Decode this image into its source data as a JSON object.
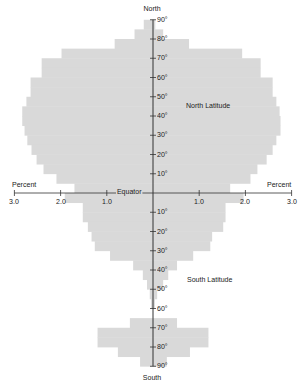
{
  "chart_data": {
    "type": "bar",
    "orientation": "horizontal-butterfly",
    "title": "",
    "xlabel": "Percent",
    "ylabel": "Latitude",
    "xlim": [
      -3.0,
      3.0
    ],
    "ylim": [
      -90,
      90
    ],
    "x_ticks": [
      "3.0",
      "2.0",
      "1.0",
      "1.0",
      "2.0",
      "3.0"
    ],
    "x_tick_values": [
      -3.0,
      -2.0,
      -1.0,
      1.0,
      2.0,
      3.0
    ],
    "north_ticks": [
      "90°",
      "80°",
      "70°",
      "60°",
      "50°",
      "40°",
      "30°",
      "20°",
      "10°"
    ],
    "south_ticks": [
      "10°",
      "20°",
      "30°",
      "40°",
      "50°",
      "60°",
      "70°",
      "80°",
      "90°"
    ],
    "annotations": {
      "top": "North",
      "bottom": "South",
      "equator": "Equator",
      "north_region": "North Latitude",
      "south_region": "South Latitude",
      "percent_left": "Percent",
      "percent_right": "Percent"
    },
    "fill_color": "#d9d9d9",
    "axis_color": "#333333",
    "series": [
      {
        "name": "Left",
        "bands": [
          {
            "from": 85,
            "to": 90,
            "value": 0.2
          },
          {
            "from": 80,
            "to": 85,
            "value": 0.4
          },
          {
            "from": 75,
            "to": 80,
            "value": 0.83
          },
          {
            "from": 70,
            "to": 75,
            "value": 1.98
          },
          {
            "from": 65,
            "to": 70,
            "value": 2.41
          },
          {
            "from": 60,
            "to": 65,
            "value": 2.41
          },
          {
            "from": 55,
            "to": 60,
            "value": 2.65
          },
          {
            "from": 50,
            "to": 55,
            "value": 2.65
          },
          {
            "from": 45,
            "to": 50,
            "value": 2.74
          },
          {
            "from": 40,
            "to": 45,
            "value": 2.83
          },
          {
            "from": 35,
            "to": 40,
            "value": 2.83
          },
          {
            "from": 30,
            "to": 35,
            "value": 2.78
          },
          {
            "from": 25,
            "to": 30,
            "value": 2.72
          },
          {
            "from": 20,
            "to": 25,
            "value": 2.63
          },
          {
            "from": 15,
            "to": 20,
            "value": 2.52
          },
          {
            "from": 10,
            "to": 15,
            "value": 2.37
          },
          {
            "from": 5,
            "to": 10,
            "value": 2.09
          },
          {
            "from": 0,
            "to": 5,
            "value": 1.7
          },
          {
            "from": -5,
            "to": 0,
            "value": 1.91
          },
          {
            "from": -10,
            "to": -5,
            "value": 1.52
          },
          {
            "from": -15,
            "to": -10,
            "value": 1.52
          },
          {
            "from": -20,
            "to": -15,
            "value": 1.41
          },
          {
            "from": -25,
            "to": -20,
            "value": 1.33
          },
          {
            "from": -30,
            "to": -25,
            "value": 1.26
          },
          {
            "from": -35,
            "to": -30,
            "value": 0.93
          },
          {
            "from": -40,
            "to": -35,
            "value": 0.43
          },
          {
            "from": -45,
            "to": -40,
            "value": 0.22
          },
          {
            "from": -50,
            "to": -45,
            "value": 0.13
          },
          {
            "from": -55,
            "to": -50,
            "value": 0.07
          },
          {
            "from": -60,
            "to": -55,
            "value": 0.04
          },
          {
            "from": -65,
            "to": -60,
            "value": 0
          },
          {
            "from": -70,
            "to": -65,
            "value": 0.5
          },
          {
            "from": -75,
            "to": -70,
            "value": 1.2
          },
          {
            "from": -80,
            "to": -75,
            "value": 1.2
          },
          {
            "from": -85,
            "to": -80,
            "value": 0.76
          },
          {
            "from": -90,
            "to": -85,
            "value": 0.28
          }
        ]
      },
      {
        "name": "Right",
        "bands": [
          {
            "from": 85,
            "to": 90,
            "value": 0.05
          },
          {
            "from": 80,
            "to": 85,
            "value": 0.22
          },
          {
            "from": 75,
            "to": 80,
            "value": 0.78
          },
          {
            "from": 70,
            "to": 75,
            "value": 1.93
          },
          {
            "from": 65,
            "to": 70,
            "value": 2.33
          },
          {
            "from": 60,
            "to": 65,
            "value": 2.33
          },
          {
            "from": 55,
            "to": 60,
            "value": 2.59
          },
          {
            "from": 50,
            "to": 55,
            "value": 2.59
          },
          {
            "from": 45,
            "to": 50,
            "value": 2.67
          },
          {
            "from": 40,
            "to": 45,
            "value": 2.74
          },
          {
            "from": 35,
            "to": 40,
            "value": 2.76
          },
          {
            "from": 30,
            "to": 35,
            "value": 2.76
          },
          {
            "from": 25,
            "to": 30,
            "value": 2.67
          },
          {
            "from": 20,
            "to": 25,
            "value": 2.59
          },
          {
            "from": 15,
            "to": 20,
            "value": 2.46
          },
          {
            "from": 10,
            "to": 15,
            "value": 2.26
          },
          {
            "from": 5,
            "to": 10,
            "value": 2.11
          },
          {
            "from": 0,
            "to": 5,
            "value": 1.67
          },
          {
            "from": -5,
            "to": 0,
            "value": 1.96
          },
          {
            "from": -10,
            "to": -5,
            "value": 1.57
          },
          {
            "from": -15,
            "to": -10,
            "value": 1.57
          },
          {
            "from": -20,
            "to": -15,
            "value": 1.52
          },
          {
            "from": -25,
            "to": -20,
            "value": 1.28
          },
          {
            "from": -30,
            "to": -25,
            "value": 1.24
          },
          {
            "from": -35,
            "to": -30,
            "value": 0.87
          },
          {
            "from": -40,
            "to": -35,
            "value": 0.52
          },
          {
            "from": -45,
            "to": -40,
            "value": 0.33
          },
          {
            "from": -50,
            "to": -45,
            "value": 0.22
          },
          {
            "from": -55,
            "to": -50,
            "value": 0.09
          },
          {
            "from": -60,
            "to": -55,
            "value": 0.04
          },
          {
            "from": -65,
            "to": -60,
            "value": 0
          },
          {
            "from": -70,
            "to": -65,
            "value": 0.52
          },
          {
            "from": -75,
            "to": -70,
            "value": 1.2
          },
          {
            "from": -80,
            "to": -75,
            "value": 1.2
          },
          {
            "from": -85,
            "to": -80,
            "value": 0.8
          },
          {
            "from": -90,
            "to": -85,
            "value": 0.3
          }
        ]
      }
    ],
    "grid": false,
    "legend": null
  }
}
